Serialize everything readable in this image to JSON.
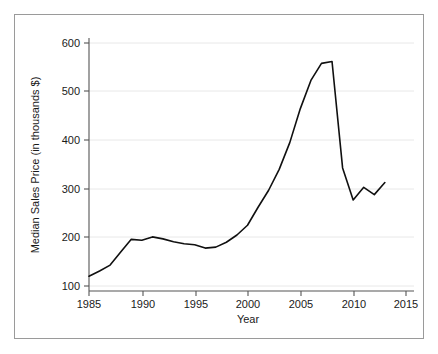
{
  "chart_data": {
    "type": "line",
    "title": "",
    "subtitle": "",
    "xlabel": "Year",
    "ylabel": "Median Sales Price (in thousands $)",
    "xlim": [
      1984,
      2016
    ],
    "ylim": [
      85,
      615
    ],
    "grid": true,
    "legend": false,
    "legend_position": "none",
    "xticks": [
      1985,
      1990,
      1995,
      2000,
      2005,
      2010,
      2015
    ],
    "xtick_labels": [
      "1985",
      "1990",
      "1995",
      "2000",
      "2005",
      "2010",
      "2015"
    ],
    "yticks": [
      100,
      200,
      300,
      400,
      500,
      600
    ],
    "ytick_labels": [
      "100",
      "200",
      "300",
      "400",
      "500",
      "600"
    ],
    "line_color": "#101010",
    "x": [
      1985,
      1986,
      1987,
      1988,
      1989,
      1990,
      1991,
      1992,
      1993,
      1994,
      1995,
      1996,
      1997,
      1998,
      1999,
      2000,
      2001,
      2002,
      2003,
      2004,
      2005,
      2006,
      2007,
      2008,
      2009,
      2010,
      2011,
      2012,
      2013
    ],
    "values": [
      120,
      131,
      143,
      170,
      196,
      194,
      201,
      197,
      191,
      187,
      185,
      178,
      180,
      190,
      205,
      225,
      262,
      297,
      340,
      395,
      465,
      523,
      558,
      562,
      343,
      277,
      303,
      288,
      313
    ],
    "series": [
      {
        "name": "Median Sales Price",
        "values": [
          120,
          131,
          143,
          170,
          196,
          194,
          201,
          197,
          191,
          187,
          185,
          178,
          180,
          190,
          205,
          225,
          262,
          297,
          340,
          395,
          465,
          523,
          558,
          562,
          343,
          277,
          303,
          288,
          313
        ]
      }
    ],
    "annotations": []
  },
  "axes": {
    "x_title": "Year",
    "y_title": "Median Sales Price (in thousands $)"
  }
}
